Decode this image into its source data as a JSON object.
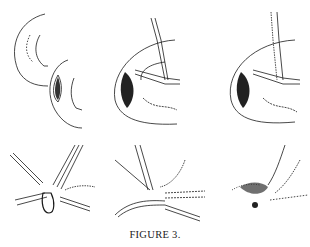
{
  "figure": {
    "caption": "FIGURE 3.",
    "panels": [
      {
        "id": "top-left",
        "row": 1,
        "col": 1,
        "description": "eyeball with incision opened"
      },
      {
        "id": "top-middle",
        "row": 1,
        "col": 2,
        "description": "incision with tube and forceps inserted"
      },
      {
        "id": "top-right",
        "row": 1,
        "col": 3,
        "description": "incision with tube and instrument withdrawing"
      },
      {
        "id": "bottom-left",
        "row": 2,
        "col": 1,
        "description": "close-up of tube with loop at junction"
      },
      {
        "id": "bottom-middle",
        "row": 2,
        "col": 2,
        "description": "close-up of tube insertion at junction"
      },
      {
        "id": "bottom-right",
        "row": 2,
        "col": 3,
        "description": "close-up of sutured closure"
      }
    ]
  },
  "colors": {
    "ink": "#1a1a1a",
    "background": "#ffffff"
  }
}
